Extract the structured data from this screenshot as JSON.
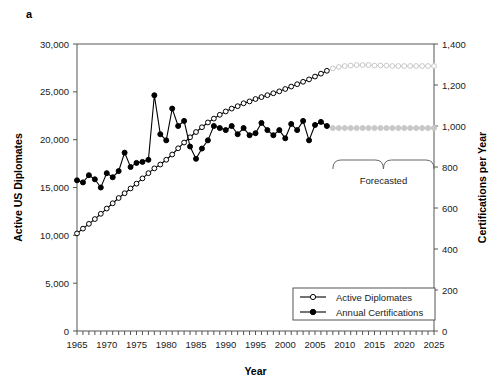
{
  "figure": {
    "panel_label": "a",
    "background_color": "#ffffff"
  },
  "axes": {
    "x": {
      "title": "Year",
      "min": 1965,
      "max": 2025,
      "tick_labels": [
        "1965",
        "1970",
        "1975",
        "1980",
        "1985",
        "1990",
        "1995",
        "2000",
        "2005",
        "2010",
        "2015",
        "2020",
        "2025"
      ],
      "tick_values": [
        1965,
        1970,
        1975,
        1980,
        1985,
        1990,
        1995,
        2000,
        2005,
        2010,
        2015,
        2020,
        2025
      ],
      "minor_tick_step": 1
    },
    "y_left": {
      "title": "Active US Diplomates",
      "min": 0,
      "max": 30000,
      "tick_labels": [
        "0",
        "5,000",
        "10,000",
        "15,000",
        "20,000",
        "25,000",
        "30,000"
      ],
      "tick_values": [
        0,
        5000,
        10000,
        15000,
        20000,
        25000,
        30000
      ]
    },
    "y_right": {
      "title": "Certifications per Year",
      "min": 0,
      "max": 1400,
      "tick_labels": [
        "0",
        "200",
        "400",
        "600",
        "800",
        "1,000",
        "1,200",
        "1,400"
      ],
      "tick_values": [
        0,
        200,
        400,
        600,
        800,
        1000,
        1200,
        1400
      ]
    }
  },
  "legend": {
    "position": "bottom-right",
    "items": [
      {
        "label": "Active Diplomates",
        "marker": "open-circle",
        "color": "#000000"
      },
      {
        "label": "Annual Certifications",
        "marker": "filled-circle",
        "color": "#000000"
      }
    ]
  },
  "annotations": [
    {
      "name": "forecast-bracket",
      "label": "Forecasted",
      "x_start": 2008,
      "x_end": 2025,
      "color": "#666666"
    }
  ],
  "chart_data": {
    "type": "line",
    "title": "",
    "xlabel": "Year",
    "ylabel": "Active US Diplomates",
    "ylabel_secondary": "Certifications per Year",
    "xlim": [
      1965,
      2025
    ],
    "ylim": [
      0,
      30000
    ],
    "ylim_secondary": [
      0,
      1400
    ],
    "grid": false,
    "legend_position": "bottom-right",
    "forecast_start_year": 2007,
    "forecast_color": "#c8c8c8",
    "series": [
      {
        "name": "Active Diplomates",
        "axis": "left",
        "marker": "open-circle",
        "color": "#000000",
        "x": [
          1965,
          1966,
          1967,
          1968,
          1969,
          1970,
          1971,
          1972,
          1973,
          1974,
          1975,
          1976,
          1977,
          1978,
          1979,
          1980,
          1981,
          1982,
          1983,
          1984,
          1985,
          1986,
          1987,
          1988,
          1989,
          1990,
          1991,
          1992,
          1993,
          1994,
          1995,
          1996,
          1997,
          1998,
          1999,
          2000,
          2001,
          2002,
          2003,
          2004,
          2005,
          2006,
          2007,
          2008,
          2009,
          2010,
          2011,
          2012,
          2013,
          2014,
          2015,
          2016,
          2017,
          2018,
          2019,
          2020,
          2021,
          2022,
          2023,
          2024,
          2025
        ],
        "y": [
          10200,
          10700,
          11200,
          11700,
          12250,
          12800,
          13350,
          13900,
          14400,
          14900,
          15400,
          15950,
          16500,
          17000,
          17400,
          17900,
          18450,
          19100,
          19700,
          20250,
          20800,
          21300,
          21800,
          22200,
          22600,
          22950,
          23250,
          23500,
          23800,
          24000,
          24250,
          24450,
          24650,
          24850,
          25050,
          25300,
          25550,
          25800,
          26050,
          26300,
          26600,
          26900,
          27200,
          27450,
          27600,
          27700,
          27750,
          27800,
          27800,
          27800,
          27750,
          27750,
          27750,
          27700,
          27700,
          27700,
          27700,
          27700,
          27700,
          27700,
          27700
        ]
      },
      {
        "name": "Annual Certifications",
        "axis": "right",
        "marker": "filled-circle",
        "color": "#000000",
        "x": [
          1965,
          1966,
          1967,
          1968,
          1969,
          1970,
          1971,
          1972,
          1973,
          1974,
          1975,
          1976,
          1977,
          1978,
          1979,
          1980,
          1981,
          1982,
          1983,
          1984,
          1985,
          1986,
          1987,
          1988,
          1989,
          1990,
          1991,
          1992,
          1993,
          1994,
          1995,
          1996,
          1997,
          1998,
          1999,
          2000,
          2001,
          2002,
          2003,
          2004,
          2005,
          2006,
          2007,
          2008,
          2009,
          2010,
          2011,
          2012,
          2013,
          2014,
          2015,
          2016,
          2017,
          2018,
          2019,
          2020,
          2021,
          2022,
          2023,
          2024,
          2025
        ],
        "y": [
          735,
          725,
          760,
          740,
          700,
          770,
          750,
          780,
          870,
          800,
          820,
          825,
          835,
          1150,
          960,
          930,
          1085,
          1000,
          1025,
          900,
          840,
          890,
          930,
          1000,
          990,
          980,
          1000,
          960,
          990,
          955,
          965,
          1015,
          980,
          955,
          980,
          940,
          1010,
          980,
          1025,
          930,
          1005,
          1020,
          1000,
          990,
          990,
          990,
          990,
          990,
          990,
          990,
          990,
          990,
          990,
          990,
          990,
          990,
          990,
          990,
          990,
          990,
          990
        ]
      }
    ]
  }
}
